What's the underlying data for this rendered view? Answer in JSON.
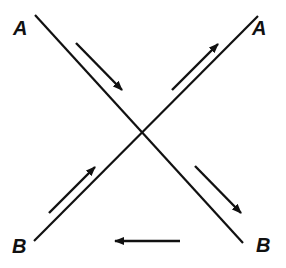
{
  "diagram": {
    "type": "crossing-lines-flow",
    "colors": {
      "line": "#111111",
      "background": "#ffffff"
    },
    "labels": {
      "top_left": "A",
      "top_right": "A",
      "bottom_left": "B",
      "bottom_right": "B"
    },
    "lines": [
      {
        "name": "line-nw-se",
        "from": "A (top-left)",
        "to": "B (bottom-right)"
      },
      {
        "name": "line-sw-ne",
        "from": "B (bottom-left)",
        "to": "A (top-right)"
      }
    ],
    "arrows": [
      {
        "name": "arrow-upper-left",
        "direction": "down-right",
        "along": "line-nw-se"
      },
      {
        "name": "arrow-upper-right",
        "direction": "up-right",
        "along": "line-sw-ne"
      },
      {
        "name": "arrow-lower-left",
        "direction": "up-right",
        "along": "line-sw-ne"
      },
      {
        "name": "arrow-lower-right",
        "direction": "down-right",
        "along": "line-nw-se"
      },
      {
        "name": "arrow-bottom-horizontal",
        "direction": "left",
        "along": "bottom B to B"
      }
    ]
  }
}
